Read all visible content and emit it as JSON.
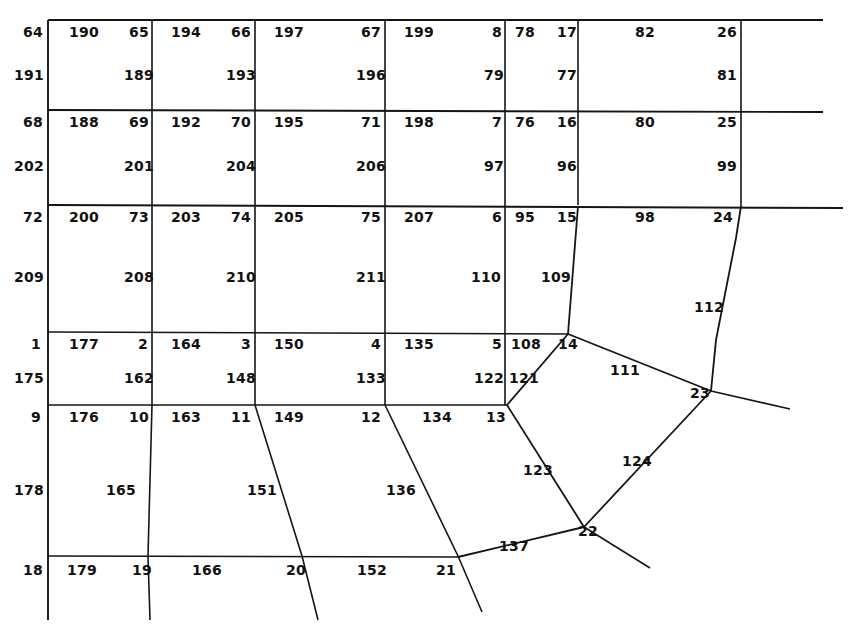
{
  "figure": {
    "width": 857,
    "height": 642,
    "background_color": "#ffffff",
    "line_color": "#151515",
    "text_color": "#111111"
  },
  "chart_data": {
    "type": "diagram",
    "grid": {
      "column_x": [
        48,
        152,
        255,
        385,
        505,
        578,
        741
      ],
      "row_y": [
        20,
        110,
        205,
        332,
        405,
        556
      ],
      "right_edge_extent": [
        823,
        827,
        843
      ],
      "bottom_extent": 620
    },
    "labels": [
      {
        "text": "64",
        "x": 33,
        "y": 32
      },
      {
        "text": "190",
        "x": 84,
        "y": 32
      },
      {
        "text": "65",
        "x": 139,
        "y": 32
      },
      {
        "text": "194",
        "x": 186,
        "y": 32
      },
      {
        "text": "66",
        "x": 241,
        "y": 32
      },
      {
        "text": "197",
        "x": 289,
        "y": 32
      },
      {
        "text": "67",
        "x": 371,
        "y": 32
      },
      {
        "text": "199",
        "x": 419,
        "y": 32
      },
      {
        "text": "8",
        "x": 497,
        "y": 32
      },
      {
        "text": "78",
        "x": 525,
        "y": 32
      },
      {
        "text": "17",
        "x": 567,
        "y": 32
      },
      {
        "text": "82",
        "x": 645,
        "y": 32
      },
      {
        "text": "26",
        "x": 727,
        "y": 32
      },
      {
        "text": "191",
        "x": 29,
        "y": 75
      },
      {
        "text": "189",
        "x": 139,
        "y": 75
      },
      {
        "text": "193",
        "x": 241,
        "y": 75
      },
      {
        "text": "196",
        "x": 371,
        "y": 75
      },
      {
        "text": "79",
        "x": 494,
        "y": 75
      },
      {
        "text": "77",
        "x": 567,
        "y": 75
      },
      {
        "text": "81",
        "x": 727,
        "y": 75
      },
      {
        "text": "68",
        "x": 33,
        "y": 122
      },
      {
        "text": "188",
        "x": 84,
        "y": 122
      },
      {
        "text": "69",
        "x": 139,
        "y": 122
      },
      {
        "text": "192",
        "x": 186,
        "y": 122
      },
      {
        "text": "70",
        "x": 241,
        "y": 122
      },
      {
        "text": "195",
        "x": 289,
        "y": 122
      },
      {
        "text": "71",
        "x": 371,
        "y": 122
      },
      {
        "text": "198",
        "x": 419,
        "y": 122
      },
      {
        "text": "7",
        "x": 497,
        "y": 122
      },
      {
        "text": "76",
        "x": 525,
        "y": 122
      },
      {
        "text": "16",
        "x": 567,
        "y": 122
      },
      {
        "text": "80",
        "x": 645,
        "y": 122
      },
      {
        "text": "25",
        "x": 727,
        "y": 122
      },
      {
        "text": "202",
        "x": 29,
        "y": 166
      },
      {
        "text": "201",
        "x": 139,
        "y": 166
      },
      {
        "text": "204",
        "x": 241,
        "y": 166
      },
      {
        "text": "206",
        "x": 371,
        "y": 166
      },
      {
        "text": "97",
        "x": 494,
        "y": 166
      },
      {
        "text": "96",
        "x": 567,
        "y": 166
      },
      {
        "text": "99",
        "x": 727,
        "y": 166
      },
      {
        "text": "72",
        "x": 33,
        "y": 217
      },
      {
        "text": "200",
        "x": 84,
        "y": 217
      },
      {
        "text": "73",
        "x": 139,
        "y": 217
      },
      {
        "text": "203",
        "x": 186,
        "y": 217
      },
      {
        "text": "74",
        "x": 241,
        "y": 217
      },
      {
        "text": "205",
        "x": 289,
        "y": 217
      },
      {
        "text": "75",
        "x": 371,
        "y": 217
      },
      {
        "text": "207",
        "x": 419,
        "y": 217
      },
      {
        "text": "6",
        "x": 497,
        "y": 217
      },
      {
        "text": "95",
        "x": 525,
        "y": 217
      },
      {
        "text": "15",
        "x": 567,
        "y": 217
      },
      {
        "text": "98",
        "x": 645,
        "y": 217
      },
      {
        "text": "24",
        "x": 723,
        "y": 217
      },
      {
        "text": "209",
        "x": 29,
        "y": 277
      },
      {
        "text": "208",
        "x": 139,
        "y": 277
      },
      {
        "text": "210",
        "x": 241,
        "y": 277
      },
      {
        "text": "211",
        "x": 371,
        "y": 277
      },
      {
        "text": "110",
        "x": 486,
        "y": 277
      },
      {
        "text": "109",
        "x": 556,
        "y": 277
      },
      {
        "text": "112",
        "x": 709,
        "y": 307
      },
      {
        "text": "1",
        "x": 36,
        "y": 344
      },
      {
        "text": "177",
        "x": 84,
        "y": 344
      },
      {
        "text": "2",
        "x": 143,
        "y": 344
      },
      {
        "text": "164",
        "x": 186,
        "y": 344
      },
      {
        "text": "3",
        "x": 246,
        "y": 344
      },
      {
        "text": "150",
        "x": 289,
        "y": 344
      },
      {
        "text": "4",
        "x": 376,
        "y": 344
      },
      {
        "text": "135",
        "x": 419,
        "y": 344
      },
      {
        "text": "5",
        "x": 497,
        "y": 344
      },
      {
        "text": "108",
        "x": 526,
        "y": 344
      },
      {
        "text": "14",
        "x": 568,
        "y": 344
      },
      {
        "text": "175",
        "x": 29,
        "y": 378
      },
      {
        "text": "162",
        "x": 139,
        "y": 378
      },
      {
        "text": "148",
        "x": 241,
        "y": 378
      },
      {
        "text": "133",
        "x": 371,
        "y": 378
      },
      {
        "text": "122",
        "x": 489,
        "y": 378
      },
      {
        "text": "121",
        "x": 524,
        "y": 378
      },
      {
        "text": "111",
        "x": 625,
        "y": 370
      },
      {
        "text": "9",
        "x": 36,
        "y": 417
      },
      {
        "text": "176",
        "x": 84,
        "y": 417
      },
      {
        "text": "10",
        "x": 139,
        "y": 417
      },
      {
        "text": "163",
        "x": 186,
        "y": 417
      },
      {
        "text": "11",
        "x": 241,
        "y": 417
      },
      {
        "text": "149",
        "x": 289,
        "y": 417
      },
      {
        "text": "12",
        "x": 371,
        "y": 417
      },
      {
        "text": "134",
        "x": 437,
        "y": 417
      },
      {
        "text": "13",
        "x": 496,
        "y": 417
      },
      {
        "text": "23",
        "x": 700,
        "y": 393
      },
      {
        "text": "178",
        "x": 29,
        "y": 490
      },
      {
        "text": "165",
        "x": 121,
        "y": 490
      },
      {
        "text": "151",
        "x": 262,
        "y": 490
      },
      {
        "text": "136",
        "x": 401,
        "y": 490
      },
      {
        "text": "123",
        "x": 538,
        "y": 470
      },
      {
        "text": "124",
        "x": 637,
        "y": 461
      },
      {
        "text": "18",
        "x": 33,
        "y": 570
      },
      {
        "text": "179",
        "x": 82,
        "y": 570
      },
      {
        "text": "19",
        "x": 142,
        "y": 570
      },
      {
        "text": "166",
        "x": 207,
        "y": 570
      },
      {
        "text": "20",
        "x": 296,
        "y": 570
      },
      {
        "text": "152",
        "x": 372,
        "y": 570
      },
      {
        "text": "21",
        "x": 446,
        "y": 570
      },
      {
        "text": "137",
        "x": 514,
        "y": 546
      },
      {
        "text": "22",
        "x": 588,
        "y": 531
      }
    ],
    "nodes_of_interest": {
      "14": [
        568,
        334
      ],
      "13": [
        507,
        405
      ],
      "23": [
        711,
        391
      ],
      "22": [
        584,
        527
      ],
      "21": [
        458,
        556
      ],
      "24": [
        741,
        205
      ],
      "19": [
        148,
        556
      ],
      "20": [
        302,
        556
      ]
    }
  }
}
